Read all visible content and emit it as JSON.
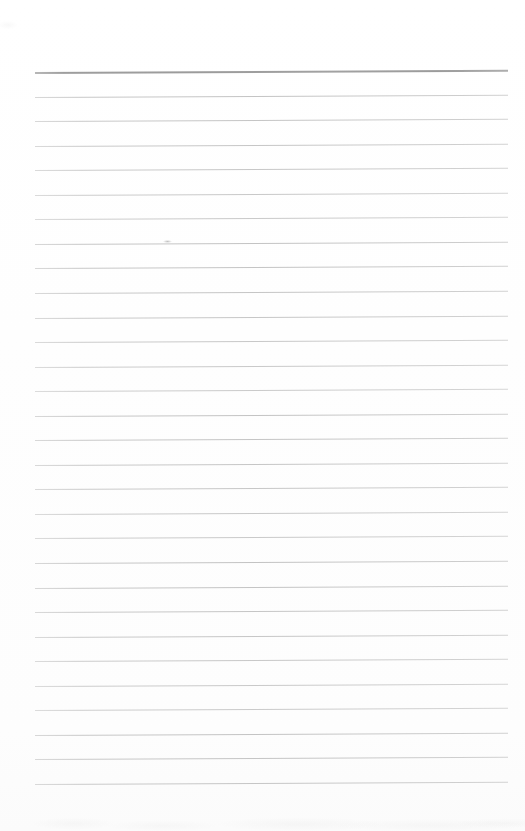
{
  "document": {
    "kind": "scanned-page",
    "title": "Blank Lined Notebook Page",
    "description": "Scanned blank ruled writing paper with no handwriting or printed text",
    "page_width": 525,
    "page_height": 831,
    "background_color": "#fefefe",
    "text_content": "",
    "visible_text": []
  },
  "ruling": {
    "line_count": 30,
    "first_line_y": 72,
    "line_spacing": 24.55,
    "left_x": 35,
    "right_x": 508,
    "tilt_degrees": -0.28,
    "header_rule_color": "#9b9b9b",
    "header_rule_thickness": 2,
    "body_rule_color": "#c6c6c6",
    "body_rule_thickness": 1,
    "margin_rule_present": false
  },
  "artifacts": {
    "bottom_scan_mottle": true,
    "top_left_speck": true,
    "stray_tick_mark": {
      "x": 163,
      "y": 240
    }
  }
}
